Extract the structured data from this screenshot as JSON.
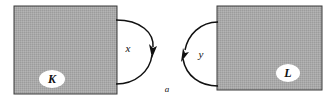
{
  "figure": {
    "background_color": "#ffffff",
    "width": 335,
    "height": 106
  },
  "regions": [
    {
      "id": "region-k",
      "label": "K",
      "fill_color": "#a8a8a8",
      "border_color": "#3a3a3a",
      "x": 14,
      "y": 6,
      "width": 103,
      "height": 88,
      "label_cx": 52,
      "label_cy": 79,
      "bubble_rx": 13,
      "bubble_ry": 9
    },
    {
      "id": "region-l",
      "label": "L",
      "fill_color": "#a8a8a8",
      "border_color": "#3a3a3a",
      "x": 217,
      "y": 6,
      "width": 105,
      "height": 84,
      "label_cx": 288,
      "label_cy": 73,
      "bubble_rx": 12,
      "bubble_ry": 9
    }
  ],
  "arcs": [
    {
      "id": "arc-x",
      "label": "x",
      "label_x": 128,
      "label_y": 52,
      "direction": "downward",
      "stroke_color": "#111111",
      "path": "M 116 20 C 142 20 155 34 153 49",
      "path_tail": "M 153 52 C 151 70 136 84 116 84",
      "arrow_tip_x": 152,
      "arrow_tip_y": 56
    },
    {
      "id": "arc-y",
      "label": "y",
      "label_x": 200,
      "label_y": 56,
      "direction": "upward",
      "stroke_color": "#111111",
      "path": "M 218 22 C 199 22 186 36 184 53",
      "path_tail": "M 186 62 C 190 78 203 86 218 86",
      "arrow_tip_x": 184,
      "arrow_tip_y": 50
    }
  ],
  "points": [
    {
      "id": "point-a",
      "label": "a",
      "x": 167,
      "y": 91
    }
  ]
}
